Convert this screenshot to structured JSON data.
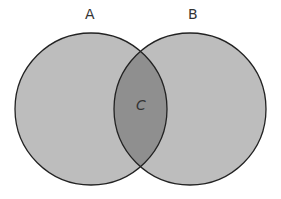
{
  "diagram": {
    "type": "venn",
    "sets": [
      {
        "label": "A",
        "cx": 91,
        "cy": 109,
        "r": 76
      },
      {
        "label": "B",
        "cx": 190,
        "cy": 109,
        "r": 76
      }
    ],
    "intersection": {
      "label": "C"
    },
    "colors": {
      "fill": "#bdbdbd",
      "overlap": "#8f8f8f",
      "stroke": "#222222"
    }
  }
}
